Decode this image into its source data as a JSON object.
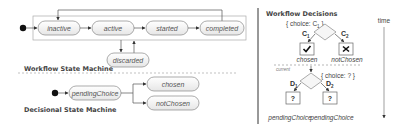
{
  "workflow_state_machine": {
    "title": "Workflow State Machine",
    "states": [
      "inactive",
      "active",
      "started",
      "completed",
      "discarded"
    ],
    "transitions": [
      [
        "initial",
        "inactive"
      ],
      [
        "inactive",
        "active"
      ],
      [
        "active",
        "started"
      ],
      [
        "started",
        "completed"
      ],
      [
        "completed",
        "inactive"
      ],
      [
        "active",
        "discarded"
      ],
      [
        "discarded",
        "active"
      ]
    ]
  },
  "decisional_state_machine": {
    "title": "Decisional State Machine",
    "states": [
      "pendingChoice",
      "chosen",
      "notChosen"
    ],
    "transitions": [
      [
        "initial",
        "pendingChoice"
      ],
      [
        "pendingChoice",
        "chosen"
      ],
      [
        "pendingChoice",
        "notChosen"
      ]
    ]
  },
  "workflow_decisions": {
    "title": "Workflow Decisions",
    "top": {
      "choice_label": "{ choice: C",
      "choice_sub": "1",
      "choice_close": " }",
      "branches": [
        {
          "label": "C",
          "sub": "1",
          "icon": "check",
          "state": "chosen"
        },
        {
          "label": "C",
          "sub": "2",
          "icon": "cross",
          "state": "notChosen"
        }
      ]
    },
    "current_label": "current",
    "bottom": {
      "choice_label": "{ choice: ? }",
      "branches": [
        {
          "label": "D",
          "sub": "1",
          "icon": "?",
          "state": "pendingChoice"
        },
        {
          "label": "D",
          "sub": "2",
          "icon": "?",
          "state": "pendingChoice"
        }
      ]
    },
    "time_label": "time"
  },
  "colors": {
    "line": "#555555",
    "state_fill": "#f4f4f4",
    "state_stroke": "#888888",
    "frame": "#aaaaaa",
    "divider": "#999999"
  }
}
